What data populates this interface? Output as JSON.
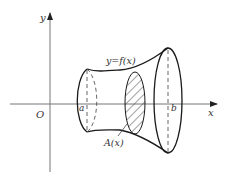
{
  "diagram": {
    "labels": {
      "y_axis": "y",
      "x_axis": "x",
      "origin": "O",
      "a": "a",
      "b": "b",
      "curve": "y=f(x)",
      "cross_section": "A(x)"
    },
    "colors": {
      "axis": "#777777",
      "outline": "#1a1a1a",
      "dashed": "#555555",
      "hatch": "#444444",
      "text": "#333333"
    }
  }
}
